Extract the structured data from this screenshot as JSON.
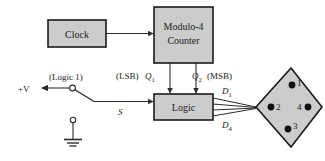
{
  "diagram": {
    "colors": {
      "box_fill": "#cccccc",
      "box_stroke": "#1a1a1a",
      "wire": "#2b2b2b",
      "dot": "#111111",
      "background": "#ffffff"
    },
    "blocks": [
      {
        "id": "clock",
        "label": "Clock"
      },
      {
        "id": "counter",
        "label_line1": "Modulo-4",
        "label_line2": "Counter"
      },
      {
        "id": "logic",
        "label": "Logic"
      }
    ],
    "labels": {
      "supply": "+V",
      "logic_one": "(Logic 1)",
      "lsb": "(LSB)",
      "q1": "Q",
      "q1_sub": "1",
      "q2": "Q",
      "q2_sub": "2",
      "msb": "(MSB)",
      "switch_signal": "S",
      "d1": "D",
      "d1_sub": "1",
      "d4": "D",
      "d4_sub": "4"
    },
    "display": {
      "shape": "diamond",
      "dots": [
        {
          "number": "1",
          "position": "top"
        },
        {
          "number": "2",
          "position": "left"
        },
        {
          "number": "4",
          "position": "right"
        },
        {
          "number": "3",
          "position": "bottom"
        }
      ]
    },
    "ground": {
      "symbol": "earth-ground"
    },
    "bus": {
      "line_count": 4
    }
  }
}
